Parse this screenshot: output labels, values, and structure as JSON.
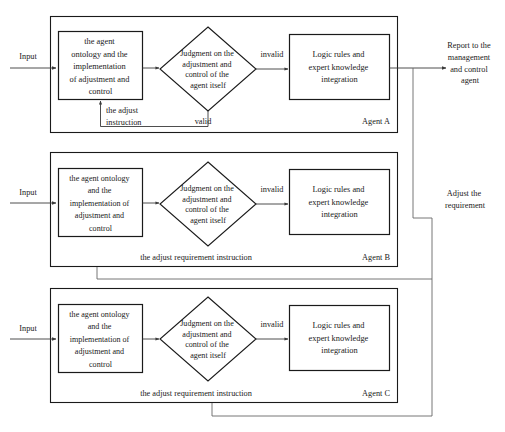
{
  "diagram": {
    "colors": {
      "stroke": "#1a1a1a",
      "line": "#3a3a3a",
      "route": "#666666",
      "background": "#ffffff"
    },
    "external": {
      "report_label_line1": "Report to the",
      "report_label_line2": "management",
      "report_label_line3": "and control",
      "report_label_line4": "agent",
      "adjust_label_line1": "Adjust the",
      "adjust_label_line2": "requirement"
    },
    "agents": [
      {
        "id": "agent-a",
        "name": "Agent A",
        "input_label": "Input",
        "ontology_lines": [
          "the agent",
          "ontology and the",
          "implementation",
          "of adjustment and",
          "control"
        ],
        "decision_lines": [
          "Judgment on the",
          "adjustment and",
          "control of the",
          "agent itself"
        ],
        "logic_lines": [
          "Logic rules and",
          "expert knowledge",
          "integration"
        ],
        "invalid_label": "invalid",
        "valid_label": "valid",
        "feedback_lines": [
          "the adjust",
          "instruction"
        ]
      },
      {
        "id": "agent-b",
        "name": "Agent B",
        "input_label": "Input",
        "ontology_lines": [
          "the agent ontology",
          "and the",
          "implementation of",
          "adjustment and",
          "control"
        ],
        "decision_lines": [
          "Judgment on the",
          "adjustment and",
          "control of the",
          "agent itself"
        ],
        "logic_lines": [
          "Logic rules and",
          "expert knowledge",
          "integration"
        ],
        "invalid_label": "invalid",
        "feedback_label": "the adjust requirement instruction"
      },
      {
        "id": "agent-c",
        "name": "Agent C",
        "input_label": "Input",
        "ontology_lines": [
          "the agent ontology",
          "and the",
          "implementation of",
          "adjustment and",
          "control"
        ],
        "decision_lines": [
          "Judgment on the",
          "adjustment and",
          "control of  the",
          "agent itself"
        ],
        "logic_lines": [
          "Logic rules and",
          "expert knowledge",
          "integration"
        ],
        "invalid_label": "invalid",
        "feedback_label": "the adjust requirement instruction"
      }
    ]
  }
}
